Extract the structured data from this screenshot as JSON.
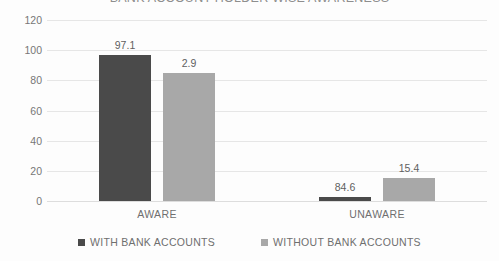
{
  "chart_data": {
    "type": "bar",
    "title": "BANK ACCOUNT HOLDER WISE AWARENESS",
    "xlabel": "",
    "ylabel": "",
    "categories": [
      "AWARE",
      "UNAWARE"
    ],
    "series": [
      {
        "name": "WITH BANK ACCOUNTS",
        "color": "#4a4a4a",
        "values": [
          97.1,
          2.9
        ]
      },
      {
        "name": "WITHOUT BANK ACCOUNTS",
        "color": "#a8a8a8",
        "values": [
          84.6,
          15.4
        ]
      }
    ],
    "ylim": [
      0,
      120
    ],
    "yticks": [
      0,
      20,
      40,
      60,
      80,
      100,
      120
    ],
    "ytick_labels": [
      "0",
      "20",
      "40",
      "60",
      "80",
      "100",
      "120"
    ],
    "data_labels": [
      [
        "97.1",
        "84.6"
      ],
      [
        "2.9",
        "15.4"
      ]
    ],
    "grid": true,
    "grid_axis": "y",
    "legend_position": "bottom"
  }
}
